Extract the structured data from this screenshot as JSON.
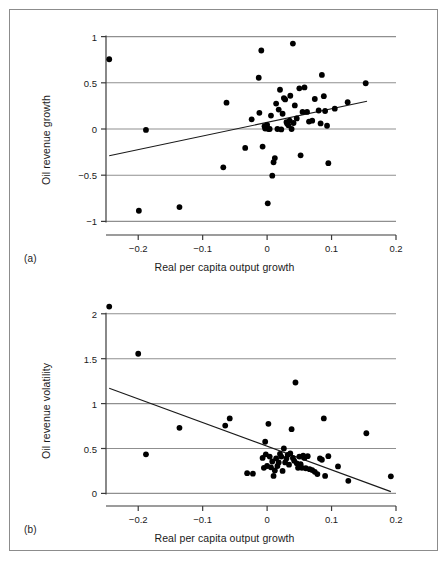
{
  "figure": {
    "panel_a_tag": "(a)",
    "panel_b_tag": "(b)",
    "border_color": "#8c8c8c",
    "point_color": "#000000",
    "gridline_color": "#8f8f8f",
    "axis_color": "#3a3a3a",
    "fit_line_color": "#1a1a1a"
  },
  "chart_data": [
    {
      "type": "scatter",
      "panel": "(a)",
      "title": "",
      "xlabel": "Real per capita output growth",
      "ylabel": "Oil revenue growth",
      "xlim": [
        -0.25,
        0.2
      ],
      "ylim": [
        -1.05,
        1.05
      ],
      "xticks": [
        -0.2,
        -0.1,
        0,
        0.1,
        0.2
      ],
      "xticklabels": [
        "−0.2",
        "−0.1",
        "0",
        "0.1",
        "0.2"
      ],
      "yticks": [
        -1,
        -0.5,
        0,
        0.5,
        1
      ],
      "yticklabels": [
        "−1",
        "−0.5",
        "0",
        "0.5",
        "1"
      ],
      "grid": "horizontal",
      "legend": "none",
      "points": [
        [
          -0.245,
          0.755
        ],
        [
          -0.188,
          -0.01
        ],
        [
          -0.199,
          -0.885
        ],
        [
          -0.136,
          -0.845
        ],
        [
          -0.063,
          0.285
        ],
        [
          -0.068,
          -0.415
        ],
        [
          -0.034,
          -0.205
        ],
        [
          -0.024,
          0.105
        ],
        [
          -0.013,
          0.555
        ],
        [
          -0.012,
          0.175
        ],
        [
          -0.009,
          0.85
        ],
        [
          -0.007,
          -0.19
        ],
        [
          -0.004,
          0.03
        ],
        [
          -0.003,
          0.005
        ],
        [
          0.0,
          0.045
        ],
        [
          0.001,
          -0.805
        ],
        [
          0.002,
          0.0
        ],
        [
          0.004,
          0.0
        ],
        [
          0.006,
          0.145
        ],
        [
          0.008,
          -0.505
        ],
        [
          0.01,
          -0.36
        ],
        [
          0.012,
          -0.315
        ],
        [
          0.014,
          0.275
        ],
        [
          0.016,
          0.0
        ],
        [
          0.018,
          0.21
        ],
        [
          0.02,
          0.425
        ],
        [
          0.022,
          -0.005
        ],
        [
          0.024,
          0.165
        ],
        [
          0.026,
          0.335
        ],
        [
          0.028,
          0.32
        ],
        [
          0.03,
          0.075
        ],
        [
          0.031,
          0.06
        ],
        [
          0.033,
          0.04
        ],
        [
          0.035,
          0.09
        ],
        [
          0.036,
          0.36
        ],
        [
          0.038,
          0.0
        ],
        [
          0.04,
          0.925
        ],
        [
          0.041,
          0.065
        ],
        [
          0.043,
          0.255
        ],
        [
          0.046,
          0.115
        ],
        [
          0.05,
          0.44
        ],
        [
          0.052,
          -0.285
        ],
        [
          0.055,
          0.185
        ],
        [
          0.058,
          0.45
        ],
        [
          0.062,
          0.185
        ],
        [
          0.065,
          0.08
        ],
        [
          0.07,
          0.09
        ],
        [
          0.074,
          0.325
        ],
        [
          0.08,
          0.2
        ],
        [
          0.083,
          0.06
        ],
        [
          0.085,
          0.585
        ],
        [
          0.088,
          0.355
        ],
        [
          0.09,
          0.195
        ],
        [
          0.093,
          0.035
        ],
        [
          0.095,
          -0.37
        ],
        [
          0.105,
          0.22
        ],
        [
          0.125,
          0.29
        ],
        [
          0.153,
          0.495
        ]
      ],
      "fit_line": {
        "x": [
          -0.245,
          0.155
        ],
        "y": [
          -0.29,
          0.3
        ]
      }
    },
    {
      "type": "scatter",
      "panel": "(b)",
      "title": "",
      "xlabel": "Real per capita output growth",
      "ylabel": "Oil revenue volatility",
      "xlim": [
        -0.25,
        0.2
      ],
      "ylim": [
        -0.04,
        2.12
      ],
      "xticks": [
        -0.2,
        -0.1,
        0,
        0.1,
        0.2
      ],
      "xticklabels": [
        "−0.2",
        "−0.1",
        "0",
        "0.1",
        "0.2"
      ],
      "yticks": [
        0,
        0.5,
        1,
        1.5,
        2
      ],
      "yticklabels": [
        "0",
        "0.5",
        "1",
        "1.5",
        "2"
      ],
      "grid": "horizontal",
      "legend": "none",
      "points": [
        [
          -0.245,
          2.08
        ],
        [
          -0.2,
          1.555
        ],
        [
          -0.188,
          0.435
        ],
        [
          -0.136,
          0.73
        ],
        [
          -0.065,
          0.755
        ],
        [
          -0.058,
          0.835
        ],
        [
          -0.031,
          0.225
        ],
        [
          -0.022,
          0.22
        ],
        [
          -0.007,
          0.395
        ],
        [
          -0.005,
          0.285
        ],
        [
          -0.003,
          0.575
        ],
        [
          -0.002,
          0.435
        ],
        [
          0.0,
          0.305
        ],
        [
          0.002,
          0.775
        ],
        [
          0.004,
          0.41
        ],
        [
          0.006,
          0.29
        ],
        [
          0.008,
          0.355
        ],
        [
          0.01,
          0.195
        ],
        [
          0.012,
          0.255
        ],
        [
          0.014,
          0.39
        ],
        [
          0.016,
          0.305
        ],
        [
          0.018,
          0.345
        ],
        [
          0.02,
          0.44
        ],
        [
          0.022,
          0.41
        ],
        [
          0.024,
          0.25
        ],
        [
          0.026,
          0.5
        ],
        [
          0.028,
          0.345
        ],
        [
          0.03,
          0.39
        ],
        [
          0.032,
          0.43
        ],
        [
          0.034,
          0.32
        ],
        [
          0.036,
          0.445
        ],
        [
          0.038,
          0.715
        ],
        [
          0.04,
          0.395
        ],
        [
          0.042,
          0.365
        ],
        [
          0.044,
          1.235
        ],
        [
          0.046,
          0.335
        ],
        [
          0.048,
          0.285
        ],
        [
          0.05,
          0.41
        ],
        [
          0.052,
          0.325
        ],
        [
          0.054,
          0.285
        ],
        [
          0.056,
          0.42
        ],
        [
          0.058,
          0.395
        ],
        [
          0.06,
          0.28
        ],
        [
          0.063,
          0.415
        ],
        [
          0.066,
          0.27
        ],
        [
          0.07,
          0.26
        ],
        [
          0.074,
          0.24
        ],
        [
          0.078,
          0.215
        ],
        [
          0.082,
          0.39
        ],
        [
          0.085,
          0.375
        ],
        [
          0.088,
          0.835
        ],
        [
          0.09,
          0.195
        ],
        [
          0.095,
          0.415
        ],
        [
          0.11,
          0.3
        ],
        [
          0.126,
          0.14
        ],
        [
          0.154,
          0.67
        ],
        [
          0.192,
          0.19
        ]
      ],
      "fit_line": {
        "x": [
          -0.245,
          0.192
        ],
        "y": [
          1.17,
          0.02
        ]
      }
    }
  ]
}
